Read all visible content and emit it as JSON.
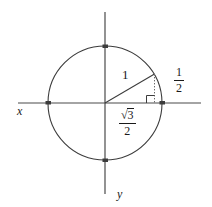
{
  "figure": {
    "background_color": "#ffffff",
    "stroke_color": "#3c3c3c",
    "text_color": "#1a1a1a"
  },
  "axes": {
    "x_label": "x",
    "y_label": "y",
    "x_axis": {
      "x1": 18,
      "y1": 103,
      "x2": 201,
      "y2": 103
    },
    "y_axis": {
      "x1": 105,
      "y1": 12,
      "x2": 105,
      "y2": 194
    }
  },
  "circle": {
    "center_x": 105,
    "center_y": 103,
    "radius": 57
  },
  "tick_points": [
    {
      "name": "right-intercept",
      "x": 162,
      "y": 103
    },
    {
      "name": "left-intercept",
      "x": 48,
      "y": 103
    },
    {
      "name": "top-intercept",
      "x": 105,
      "y": 46
    },
    {
      "name": "bottom-intercept",
      "x": 105,
      "y": 160
    }
  ],
  "terminal_point": {
    "x": 154,
    "y": 74
  },
  "radius_line": {
    "x1": 105,
    "y1": 103,
    "x2": 154,
    "y2": 74
  },
  "drop_line": {
    "x1": 154,
    "y1": 74,
    "x2": 154,
    "y2": 103,
    "style": "dotted"
  },
  "right_angle_marker": {
    "x": 146,
    "y": 95,
    "size": 8
  },
  "labels": {
    "radius": "1",
    "opposite_numerator": "1",
    "opposite_denominator": "2",
    "adjacent_numerator": "3",
    "adjacent_denominator": "2",
    "adjacent_radical": "√"
  }
}
